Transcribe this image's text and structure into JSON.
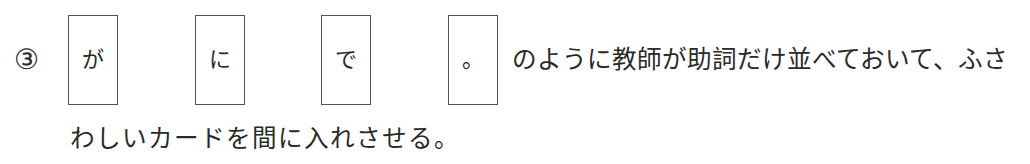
{
  "item_number": "③",
  "cards": [
    {
      "label": "が"
    },
    {
      "label": "に"
    },
    {
      "label": "で"
    },
    {
      "label": "。"
    }
  ],
  "text": {
    "line1": "のように教師が助詞だけ並べておいて、ふさ",
    "line2": "わしいカードを間に入れさせる。"
  },
  "colors": {
    "text": "#2a2a2a",
    "card_border": "#555555",
    "background": "#ffffff"
  }
}
